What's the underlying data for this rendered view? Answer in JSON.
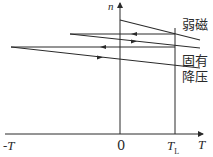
{
  "diagram": {
    "title": "",
    "axes": {
      "y_label": "n",
      "x_label": "T",
      "x_ticks": [
        "-T",
        "0",
        "T_L"
      ],
      "t_l_main": "T",
      "t_l_sub": "L"
    },
    "curves": [
      {
        "id": "weak-field",
        "label": "弱磁"
      },
      {
        "id": "natural",
        "label": "固有"
      },
      {
        "id": "reduced-voltage",
        "label": "降压"
      }
    ],
    "colors": {
      "line": "#2a2a2a",
      "background": "#ffffff"
    }
  }
}
